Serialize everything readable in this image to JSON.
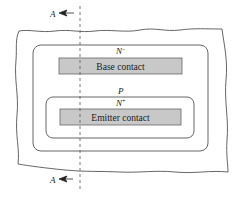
{
  "diagram": {
    "type": "semiconductor top view",
    "section_marker": {
      "label": "A",
      "top_label": "A",
      "bottom_label": "A"
    },
    "regions": {
      "outer": {
        "label": "N⁻",
        "label_main": "N",
        "label_sup": "−"
      },
      "base": {
        "label": "P"
      },
      "emitter": {
        "label": "N⁺",
        "label_main": "N",
        "label_sup": "+"
      }
    },
    "contacts": {
      "base": {
        "label": "Base contact"
      },
      "emitter": {
        "label": "Emitter contact"
      }
    },
    "colors": {
      "line": "#555555",
      "contact_fill": "#c8c8c8",
      "contact_stroke": "#666666",
      "background": "#ffffff"
    }
  }
}
